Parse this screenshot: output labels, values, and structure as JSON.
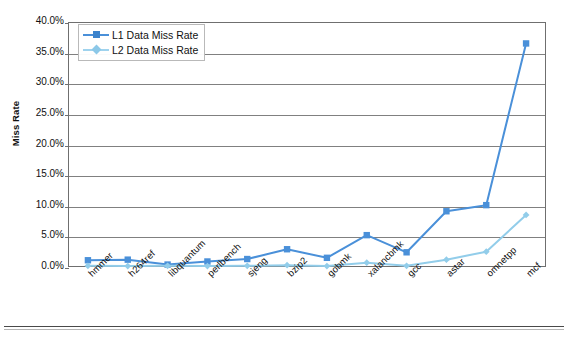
{
  "chart_data": {
    "type": "line",
    "title": "",
    "xlabel": "",
    "ylabel": "Miss Rate",
    "ylim": [
      0,
      40
    ],
    "ytick_labels": [
      "40.0%",
      "35.0%",
      "30.0%",
      "25.0%",
      "20.0%",
      "15.0%",
      "10.0%",
      "5.0%",
      "0.0%"
    ],
    "ytick_values": [
      40,
      35,
      30,
      25,
      20,
      15,
      10,
      5,
      0
    ],
    "grid": true,
    "legend_position": "top-left",
    "categories": [
      "hmmer",
      "h264ref",
      "libquantum",
      "perlbench",
      "sjeng",
      "bzip2",
      "gobmk",
      "xalancbmk",
      "gcc",
      "astar",
      "omnetpp",
      "mcf"
    ],
    "series": [
      {
        "name": "L1 Data Miss Rate",
        "color": "#4A90D9",
        "marker": "square",
        "values": [
          1.1,
          1.2,
          0.4,
          0.9,
          1.3,
          2.9,
          1.5,
          5.2,
          2.4,
          9.1,
          10.1,
          36.5
        ]
      },
      {
        "name": "L2 Data Miss Rate",
        "color": "#92CDEA",
        "marker": "diamond",
        "values": [
          0.2,
          0.15,
          0.2,
          0.15,
          0.2,
          0.3,
          0.15,
          0.7,
          0.2,
          1.2,
          2.5,
          8.5
        ]
      }
    ]
  },
  "axis": {
    "y_title": "Miss Rate"
  },
  "legend": {
    "items": [
      {
        "label": "L1 Data Miss Rate"
      },
      {
        "label": "L2 Data Miss Rate"
      }
    ]
  },
  "colors": {
    "series_l1": "#4A90D9",
    "series_l2": "#92CDEA",
    "gridline": "#808080",
    "frame": "#6f6f6f",
    "text": "#111111"
  }
}
